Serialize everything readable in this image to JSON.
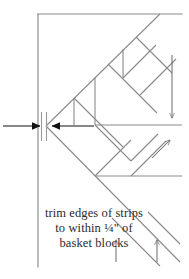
{
  "figure": {
    "width": 189,
    "height": 279,
    "background_color": "#ffffff"
  },
  "colors": {
    "line": "#8a8a8a",
    "line_dark": "#6f6f6f",
    "arrow": "#111111",
    "text": "#2b2b2b",
    "strip_line": "#9a9a9a"
  },
  "caption": {
    "line1": "trim edges of strips",
    "line2": "to within ¼\" of",
    "line3": "basket blocks",
    "full_text": "trim edges of strips to within ¼\" of basket blocks"
  },
  "annotations": {
    "dimension_label": "¼\"",
    "left_arrow_name": "left-dimension-arrow",
    "right_arrow_name": "right-dimension-arrow",
    "strip_label": "trim strip width"
  },
  "geometry": {
    "border_top_y": 14,
    "border_left_x": 38,
    "border_right_x": 182,
    "border_bottom_y": 267,
    "strip_line_1_x": 41,
    "strip_line_2_x": 46,
    "dimension_arrow_y": 126,
    "center_junction_x": 95,
    "center_junction_y": 125
  }
}
